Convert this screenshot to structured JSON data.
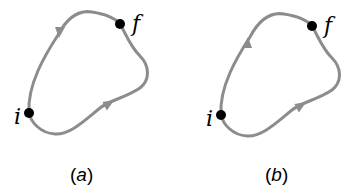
{
  "figure": {
    "colors": {
      "path": "#8c8c8c",
      "point": "#000000",
      "background": "#ffffff"
    },
    "panels": [
      {
        "id": "a",
        "label_open": "(",
        "label_letter": "a",
        "label_close": ")",
        "initial_point_label": "i",
        "final_point_label": "f",
        "upper_path_direction": "f-to-i",
        "lower_path_direction": "i-to-f"
      },
      {
        "id": "b",
        "label_open": "(",
        "label_letter": "b",
        "label_close": ")",
        "initial_point_label": "i",
        "final_point_label": "f",
        "upper_path_direction": "i-to-f",
        "lower_path_direction": "i-to-f"
      }
    ]
  }
}
